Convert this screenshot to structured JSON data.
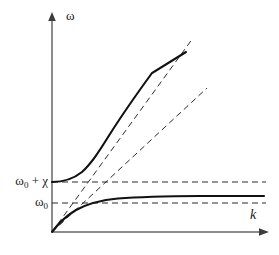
{
  "figure": {
    "type": "dispersion-diagram",
    "background_color": "#ffffff",
    "line_color": "#1a1a1a",
    "axis_color": "#808080",
    "axes": {
      "y_axis_label": "ω",
      "x_axis_label": "k",
      "origin": [
        52,
        232
      ],
      "y_axis_top": [
        52,
        14
      ],
      "x_axis_right": [
        268,
        232
      ]
    },
    "tick_labels": [
      {
        "name": "upper-branch-asymptote",
        "text_main": "ω",
        "text_sub": "0",
        "text_tail": " + χ",
        "y": 182
      },
      {
        "name": "lower-branch-asymptote",
        "text_main": "ω",
        "text_sub": "0",
        "text_tail": "",
        "y": 203
      }
    ],
    "curves": [
      {
        "name": "upper-polariton-branch",
        "style": "solid",
        "description": "Upper branch starting at ω₀+χ on the vertical axis, curving upward and approaching the steep light line asymptotically."
      },
      {
        "name": "lower-polariton-branch",
        "style": "solid",
        "description": "Lower branch rising from the origin along the steep light line and flattening asymptotically toward ω₀."
      }
    ],
    "asymptotes": [
      {
        "name": "steep-light-line",
        "style": "dashed",
        "from": [
          52,
          232
        ],
        "to": [
          193,
          38
        ]
      },
      {
        "name": "shallow-light-line",
        "style": "dashed",
        "from": [
          52,
          232
        ],
        "to": [
          207,
          88
        ]
      },
      {
        "name": "omega0-plus-chi-level",
        "style": "dashed",
        "from": [
          52,
          182
        ],
        "to": [
          266,
          182
        ]
      },
      {
        "name": "omega0-level",
        "style": "dashed",
        "from": [
          52,
          203
        ],
        "to": [
          266,
          203
        ]
      }
    ]
  },
  "chart_data": {
    "type": "line",
    "title": "",
    "xlabel": "k",
    "ylabel": "ω",
    "grid": false,
    "legend": "none",
    "xlim": [
      0,
      1
    ],
    "ylim": [
      0,
      1
    ],
    "annotations": [
      "ω₀ + χ",
      "ω₀"
    ],
    "series": [
      {
        "name": "upper-polariton-branch",
        "style": "solid",
        "x": [
          0,
          0.04,
          0.08,
          0.12,
          0.16,
          0.2,
          0.26,
          0.32,
          0.4,
          0.48,
          0.56,
          0.66
        ],
        "y": [
          0.232,
          0.236,
          0.246,
          0.266,
          0.296,
          0.336,
          0.406,
          0.478,
          0.572,
          0.664,
          0.754,
          0.866
        ]
      },
      {
        "name": "lower-polariton-branch",
        "style": "solid",
        "x": [
          0,
          0.04,
          0.08,
          0.12,
          0.16,
          0.22,
          0.3,
          0.4,
          0.52,
          0.66,
          0.8,
          1.0
        ],
        "y": [
          0.0,
          0.056,
          0.104,
          0.142,
          0.17,
          0.196,
          0.212,
          0.219,
          0.222,
          0.223,
          0.223,
          0.223
        ]
      },
      {
        "name": "steep-light-line",
        "style": "dashed",
        "x": [
          0,
          0.66
        ],
        "y": [
          0.0,
          0.904
        ]
      },
      {
        "name": "shallow-light-line",
        "style": "dashed",
        "x": [
          0,
          0.72
        ],
        "y": [
          0.0,
          0.672
        ]
      },
      {
        "name": "omega0-plus-chi-level",
        "style": "dashed",
        "x": [
          0,
          1.0
        ],
        "y": [
          0.232,
          0.232
        ]
      },
      {
        "name": "omega0-level",
        "style": "dashed",
        "x": [
          0,
          1.0
        ],
        "y": [
          0.135,
          0.135
        ]
      }
    ]
  }
}
